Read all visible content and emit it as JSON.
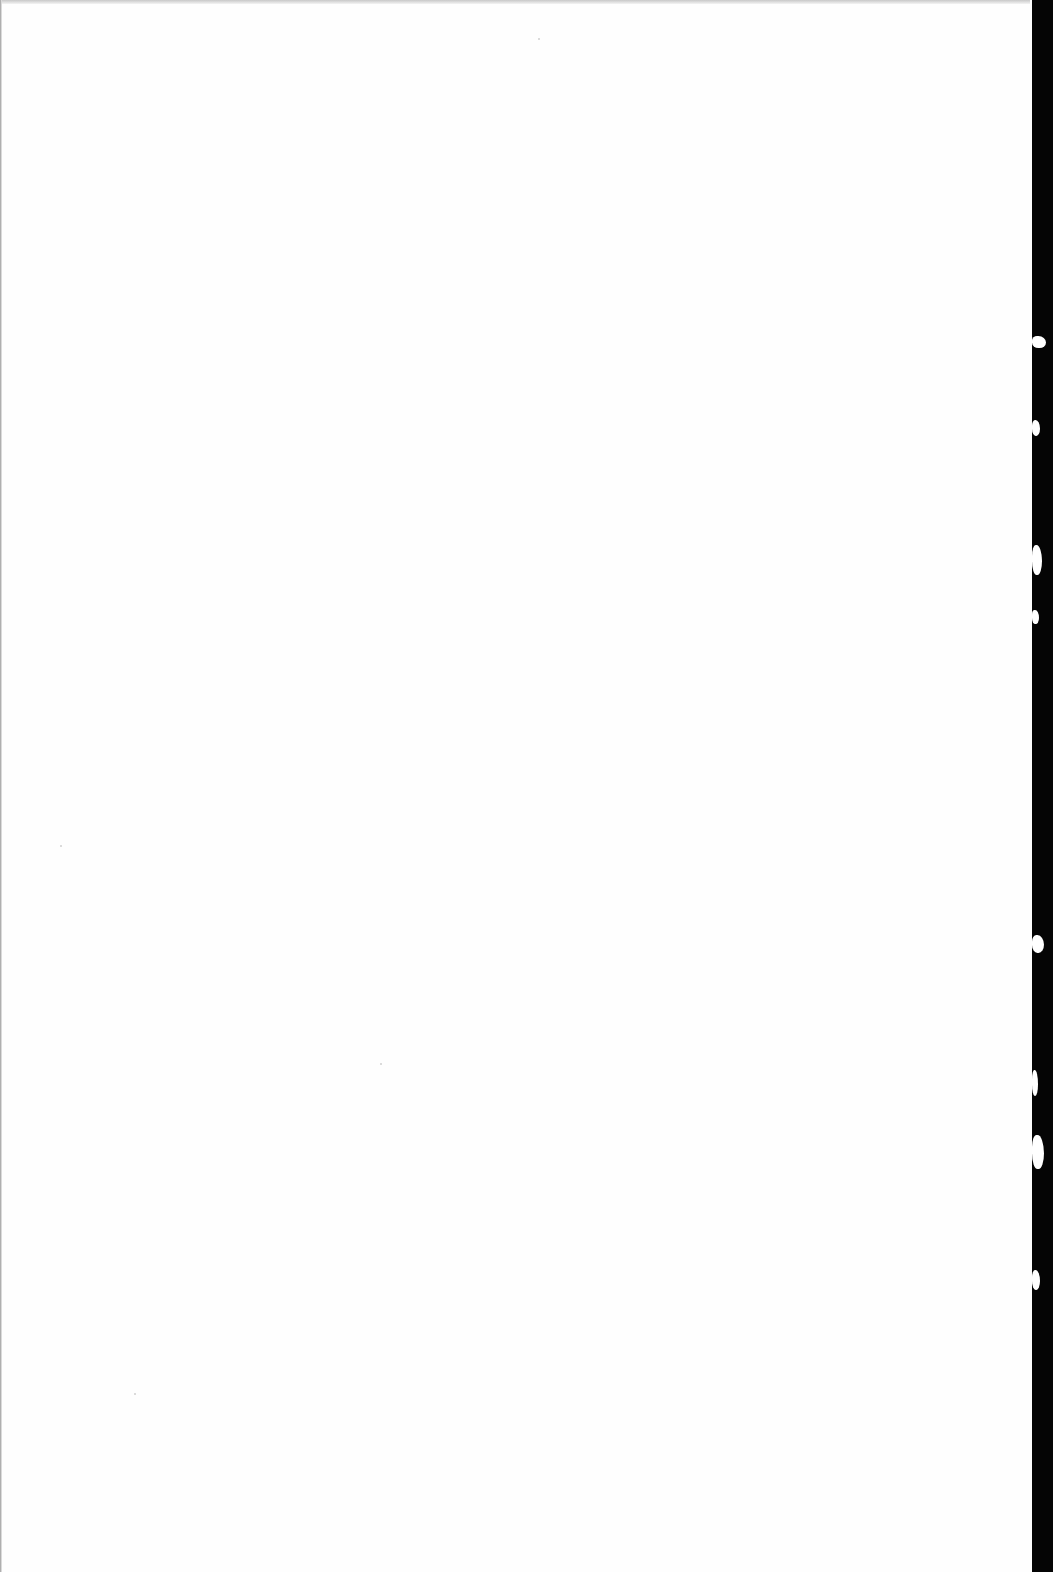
{
  "document": {
    "type": "scanned-page",
    "content": "",
    "text_blocks": []
  },
  "colors": {
    "paper": "#fefefe",
    "binding_edge": "#050505",
    "top_shade": "#c8c8c8"
  },
  "tears": [
    {
      "top": 336,
      "height": 12,
      "width": 14
    },
    {
      "top": 420,
      "height": 16,
      "width": 8
    },
    {
      "top": 545,
      "height": 30,
      "width": 10
    },
    {
      "top": 610,
      "height": 14,
      "width": 7
    },
    {
      "top": 935,
      "height": 18,
      "width": 12
    },
    {
      "top": 1070,
      "height": 26,
      "width": 6
    },
    {
      "top": 1135,
      "height": 34,
      "width": 12
    },
    {
      "top": 1270,
      "height": 20,
      "width": 8
    }
  ]
}
